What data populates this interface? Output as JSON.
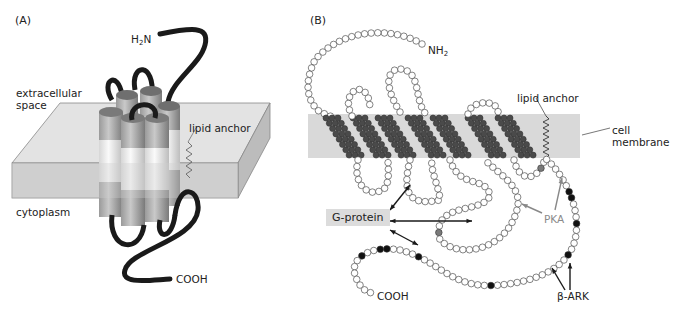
{
  "panel_a": {
    "tag": "(A)",
    "labels": {
      "n_terminus": "H2N",
      "extracellular": "extracellular",
      "extracellular_2": "space",
      "lipid_anchor": "lipid anchor",
      "cytoplasm": "cytoplasm",
      "c_terminus": "COOH"
    },
    "helix_count": 7
  },
  "panel_b": {
    "tag": "(B)",
    "labels": {
      "n_terminus": "NH",
      "n_terminus_sub": "2",
      "lipid_anchor": "lipid anchor",
      "cell": "cell",
      "membrane": "membrane",
      "g_protein": "G-protein",
      "pka": "PKA",
      "c_terminus": "COOH",
      "beta_ark": "β-ARK"
    },
    "transmembrane_segments": 7
  },
  "colors": {
    "membrane": "#d9d9d9",
    "helix_residue": "#4a4a4a",
    "loop_residue": "#ffffff",
    "phospho_site_bark": "#111111",
    "phospho_site_pka": "#7a7a7a",
    "chain": "#1a1a1a",
    "cylinder_dark": "#7d7d7d",
    "cylinder_light": "#e8e8e8"
  }
}
